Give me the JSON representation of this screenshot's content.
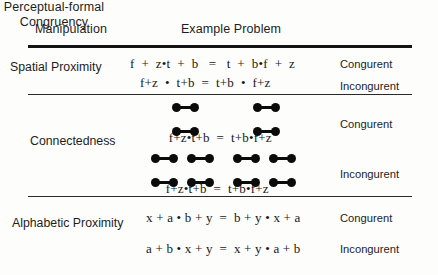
{
  "figure": {
    "headers": {
      "manipulation": "Manipulation",
      "example_problem": "Example Problem",
      "congruency_line1": "Perceptual-formal",
      "congruency_line2": "Congruency"
    },
    "congruency_labels": {
      "congruent": "Congurent",
      "incongruent": "Incongurent"
    },
    "sections": [
      {
        "label": "Spatial Proximity",
        "rows": [
          {
            "equation": "f  +  z•t  +  b   =   t  +  b•f  +  z",
            "congruency": "Congurent",
            "connected": false
          },
          {
            "equation": "f+z  •  t+b  =  t+b  •  f+z",
            "congruency": "Incongurent",
            "connected": false
          }
        ]
      },
      {
        "label": "Connectedness",
        "rows": [
          {
            "equation": "f+z•t+b  =  t+b•f+z",
            "congruency": "Congurent",
            "connected": true,
            "groups": "operand-pairs-around-multiplication"
          },
          {
            "equation": "f+z•t+b  =  t+b•f+z",
            "congruency": "Incongurent",
            "connected": true,
            "groups": "operand-pairs-around-addition"
          }
        ]
      },
      {
        "label": "Alphabetic Proximity",
        "rows": [
          {
            "equation": "x + a • b + y  =  b + y • x + a",
            "congruency": "Congurent",
            "connected": false
          },
          {
            "equation": "a + b • x + y  =  x + y • a + b",
            "congruency": "Incongurent",
            "connected": false
          }
        ]
      }
    ],
    "colors": {
      "ink": "#141414",
      "background": "#fdfdfc",
      "marker": "#0b0b0b"
    }
  }
}
